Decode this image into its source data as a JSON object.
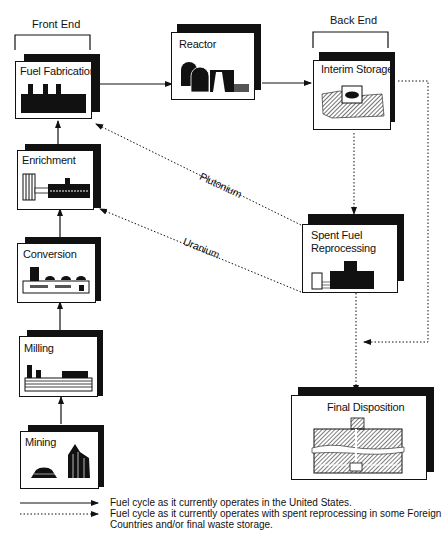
{
  "headers": {
    "front_end": "Front End",
    "back_end": "Back End"
  },
  "stages": {
    "fuel_fabrication": "Fuel Fabrication",
    "reactor": "Reactor",
    "interim_storage": "Interim Storage",
    "enrichment": "Enrichment",
    "conversion": "Conversion",
    "milling": "Milling",
    "mining": "Mining",
    "spent_fuel_reprocessing_line1": "Spent Fuel",
    "spent_fuel_reprocessing_line2": "Reprocessing",
    "final_disposition": "Final Disposition"
  },
  "flows": {
    "plutonium": "Plutonium",
    "uranium": "Uranium"
  },
  "legend": {
    "solid": "Fuel cycle as it currently operates in the United States.",
    "dotted_line1": "Fuel cycle as it currently operates with spent reprocessing in some Foreign",
    "dotted_line2": "Countries and/or final waste storage."
  }
}
